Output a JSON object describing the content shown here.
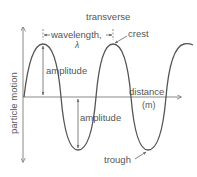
{
  "diagram": {
    "title": "transverse",
    "labels": {
      "wavelength": "wavelength,",
      "lambda": "λ",
      "crest": "crest",
      "amplitude_top": "amplitude",
      "amplitude_bottom": "amplitude",
      "x_axis": "distance",
      "x_axis_unit": "(m)",
      "y_axis": "particle motion",
      "trough": "trough"
    },
    "colors": {
      "wave": "#555555",
      "axes": "#888888",
      "text": "#555555"
    }
  }
}
